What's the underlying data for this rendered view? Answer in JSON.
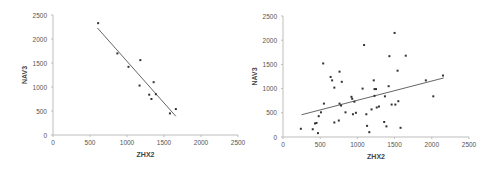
{
  "chart_data": [
    {
      "type": "scatter",
      "title": "",
      "xlabel": "ZHX2",
      "ylabel": "NAV3",
      "xlim": [
        0,
        2500
      ],
      "ylim": [
        0,
        2500
      ],
      "xticks": [
        0,
        500,
        1000,
        1500,
        2000,
        2500
      ],
      "yticks": [
        0,
        500,
        1000,
        1500,
        2000,
        2500
      ],
      "grid": false,
      "legend": null,
      "points": [
        [
          610,
          2330
        ],
        [
          870,
          1700
        ],
        [
          1020,
          1420
        ],
        [
          1180,
          1560
        ],
        [
          1170,
          1030
        ],
        [
          1300,
          840
        ],
        [
          1330,
          750
        ],
        [
          1360,
          1100
        ],
        [
          1390,
          850
        ],
        [
          1580,
          450
        ],
        [
          1660,
          540
        ]
      ],
      "trendline": {
        "x": [
          600,
          1660
        ],
        "y": [
          2230,
          390
        ]
      }
    },
    {
      "type": "scatter",
      "title": "",
      "xlabel": "ZHX2",
      "ylabel": "NAV3",
      "xlim": [
        0,
        2500
      ],
      "ylim": [
        0,
        2500
      ],
      "xticks": [
        0,
        500,
        1000,
        1500,
        2000,
        2500
      ],
      "yticks": [
        0,
        500,
        1000,
        1500,
        2000,
        2500
      ],
      "grid": false,
      "legend": null,
      "points": [
        [
          240,
          170
        ],
        [
          400,
          160
        ],
        [
          430,
          280
        ],
        [
          450,
          290
        ],
        [
          470,
          80
        ],
        [
          480,
          430
        ],
        [
          510,
          510
        ],
        [
          540,
          1520
        ],
        [
          550,
          690
        ],
        [
          640,
          1240
        ],
        [
          660,
          1170
        ],
        [
          690,
          1020
        ],
        [
          690,
          300
        ],
        [
          750,
          340
        ],
        [
          760,
          1350
        ],
        [
          760,
          690
        ],
        [
          780,
          650
        ],
        [
          790,
          1140
        ],
        [
          840,
          510
        ],
        [
          920,
          830
        ],
        [
          930,
          790
        ],
        [
          940,
          470
        ],
        [
          960,
          730
        ],
        [
          980,
          500
        ],
        [
          1070,
          1000
        ],
        [
          1090,
          1900
        ],
        [
          1120,
          470
        ],
        [
          1130,
          230
        ],
        [
          1160,
          100
        ],
        [
          1190,
          570
        ],
        [
          1220,
          1170
        ],
        [
          1230,
          990
        ],
        [
          1230,
          850
        ],
        [
          1250,
          990
        ],
        [
          1260,
          610
        ],
        [
          1290,
          630
        ],
        [
          1360,
          310
        ],
        [
          1370,
          840
        ],
        [
          1390,
          220
        ],
        [
          1420,
          1050
        ],
        [
          1430,
          1670
        ],
        [
          1460,
          670
        ],
        [
          1500,
          2150
        ],
        [
          1510,
          670
        ],
        [
          1540,
          1370
        ],
        [
          1550,
          740
        ],
        [
          1580,
          190
        ],
        [
          1650,
          1680
        ],
        [
          1920,
          1170
        ],
        [
          2020,
          840
        ],
        [
          2150,
          1270
        ]
      ],
      "trendline": {
        "x": [
          250,
          2160
        ],
        "y": [
          460,
          1220
        ]
      }
    }
  ]
}
